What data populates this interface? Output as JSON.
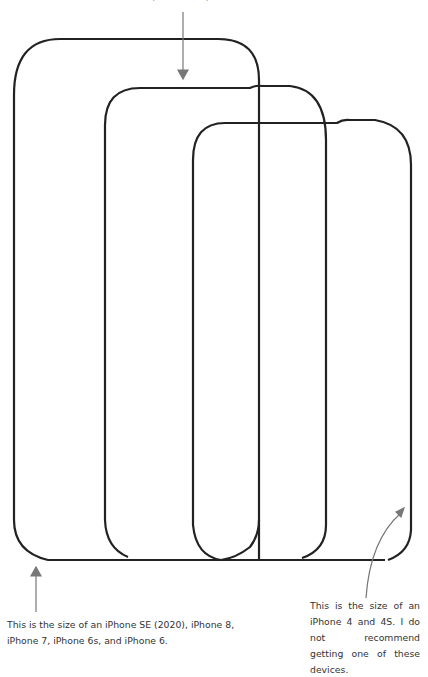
{
  "top_caption": ", iPhone XS, and iPhone X.",
  "captions": {
    "left": "This is the size of an iPhone SE (2020), iPhone 8, iPhone 7, iPhone 6s, and iPhone 6.",
    "right": "This is the size of an iPhone 4 and 4S. I do not recommend getting one of these devices."
  },
  "outlines": [
    {
      "name": "large-phone-outline",
      "x": 14,
      "y": 39,
      "width": 245,
      "height": 521
    },
    {
      "name": "medium-phone-outline",
      "x": 105,
      "y": 88,
      "width": 222,
      "height": 472
    },
    {
      "name": "small-phone-outline",
      "x": 193,
      "y": 123,
      "width": 219,
      "height": 437
    }
  ],
  "colors": {
    "outline": "#222222",
    "arrow": "#777777",
    "text": "#333333"
  }
}
